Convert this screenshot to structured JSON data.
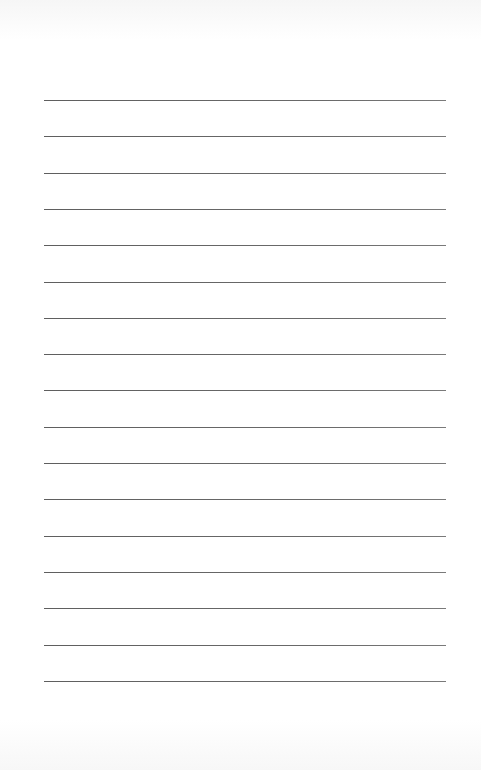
{
  "page": {
    "type": "lined-notepaper",
    "background_color": "#ffffff",
    "line_color": "#666666",
    "line_count": 17,
    "first_line_y": 100,
    "line_spacing": 36.3,
    "line_left_x": 44,
    "line_right_x": 446
  }
}
